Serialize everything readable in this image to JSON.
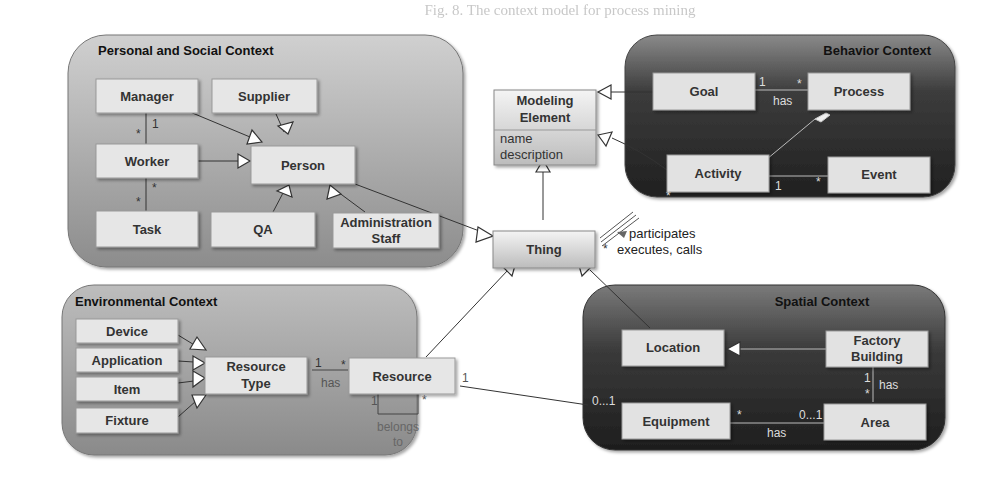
{
  "caption": "Fig. 8. The context model for process mining",
  "contexts": {
    "personal_social": {
      "title": "Personal and Social Context",
      "classes": {
        "manager": "Manager",
        "supplier": "Supplier",
        "worker": "Worker",
        "person": "Person",
        "task": "Task",
        "qa": "QA",
        "admin_staff_line1": "Administration",
        "admin_staff_line2": "Staff"
      },
      "associations": {
        "manager_worker": {
          "manager_end": "1",
          "worker_end": "*"
        },
        "worker_task": {
          "worker_end": "*",
          "task_end": "*"
        }
      }
    },
    "behavior": {
      "title": "Behavior Context",
      "classes": {
        "goal": "Goal",
        "process": "Process",
        "activity": "Activity",
        "event": "Event"
      },
      "associations": {
        "goal_process": {
          "label": "has",
          "goal_end": "1",
          "process_end": "*"
        },
        "activity_event": {
          "activity_end": "1",
          "event_end": "*"
        },
        "activity_thing": {
          "activity_end": "*"
        }
      }
    },
    "environmental": {
      "title": "Environmental Context",
      "classes": {
        "device": "Device",
        "application": "Application",
        "item": "Item",
        "fixture": "Fixture",
        "resource_type_line1": "Resource",
        "resource_type_line2": "Type",
        "resource": "Resource"
      },
      "associations": {
        "resource_type_resource": {
          "label": "has",
          "type_end": "1",
          "resource_end": "*"
        },
        "resource_self": {
          "label_line1": "belongs",
          "label_line2": "to",
          "end_a": "1",
          "end_b": "*"
        },
        "resource_equipment": {
          "resource_end": "1",
          "equipment_end": "0...1"
        }
      }
    },
    "spatial": {
      "title": "Spatial Context",
      "classes": {
        "location": "Location",
        "factory_building_line1": "Factory",
        "factory_building_line2": "Building",
        "equipment": "Equipment",
        "area": "Area"
      },
      "associations": {
        "factory_area": {
          "label": "has",
          "factory_end": "1",
          "area_end": "*"
        },
        "equipment_area": {
          "label": "has",
          "equipment_end": "*",
          "area_end": "0...1"
        }
      }
    }
  },
  "core": {
    "modeling_element": {
      "name_line1": "Modeling",
      "name_line2": "Element",
      "attributes": [
        "name",
        "description"
      ]
    },
    "thing": "Thing",
    "thing_activity": {
      "label_line1": "participates",
      "label_line2": "executes, calls",
      "thing_end": "*"
    }
  }
}
